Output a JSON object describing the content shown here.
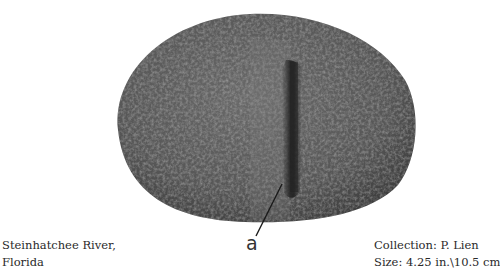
{
  "figure": {
    "callout": {
      "label": "a"
    },
    "caption_left": {
      "line1": "Steinhatchee River,",
      "line2": "Florida"
    },
    "caption_right": {
      "line1": "Collection: P. Lien",
      "line2": "Size: 4.25 in.\\10.5 cm"
    },
    "colors": {
      "background": "#ffffff",
      "stone_base": "#5a5a5a",
      "stone_dark": "#3a3a3a",
      "groove": "#262626",
      "text": "#2a2a2a"
    }
  }
}
